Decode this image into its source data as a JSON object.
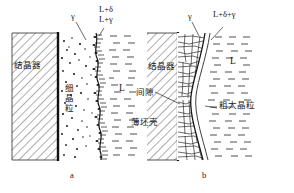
{
  "figure": {
    "width": 294,
    "height": 193,
    "background": "#ffffff",
    "ink": "#161616"
  },
  "panel_a": {
    "caption": "a",
    "labels": {
      "mold": "结晶器",
      "fine_grains": "细晶粒",
      "gamma": "γ",
      "phase_top1": "L+δ",
      "phase_top2": "L+γ",
      "liquid": "L"
    }
  },
  "panel_b": {
    "caption": "b",
    "labels": {
      "mold": "结晶器",
      "gap": "间隙",
      "thin_shell": "薄坯壳",
      "coarse_grains": "粗大晶粒",
      "gamma": "γ",
      "phase_top": "L+δ+γ",
      "liquid": "L"
    }
  }
}
